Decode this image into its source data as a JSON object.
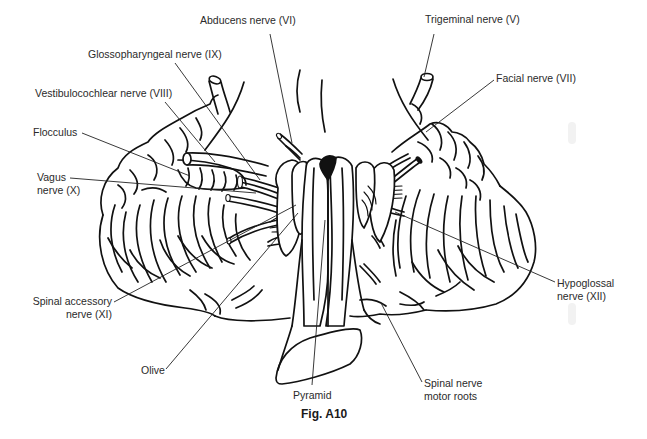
{
  "figure": {
    "caption": "Fig. A10",
    "colors": {
      "line": "#111111",
      "label_text": "#2a2a2a",
      "background": "#ffffff"
    }
  },
  "labels": [
    {
      "id": "abducens",
      "line1": "Abducens nerve (VI)",
      "line2": "",
      "x": 200,
      "y": 20,
      "align": "left",
      "leader": [
        270,
        34,
        292,
        143
      ]
    },
    {
      "id": "trigeminal",
      "line1": "Trigeminal nerve (V)",
      "line2": "",
      "x": 425,
      "y": 19,
      "align": "left",
      "leader": [
        434,
        34,
        424,
        77
      ]
    },
    {
      "id": "glossopharyngeal",
      "line1": "Glossopharyngeal nerve (IX)",
      "line2": "",
      "x": 88,
      "y": 48,
      "align": "left",
      "leader": [
        175,
        63,
        260,
        180
      ]
    },
    {
      "id": "facial",
      "line1": "Facial nerve (VII)",
      "line2": "",
      "x": 496,
      "y": 72,
      "align": "left",
      "leader": [
        494,
        80,
        426,
        132
      ]
    },
    {
      "id": "vestibulocochlear",
      "line1": "Vestibulocochlear nerve (VIII)",
      "line2": "",
      "x": 35,
      "y": 87,
      "align": "left",
      "leader": [
        165,
        102,
        215,
        162
      ]
    },
    {
      "id": "flocculus",
      "line1": "Flocculus",
      "line2": "",
      "x": 33,
      "y": 125,
      "align": "left",
      "leader": [
        82,
        133,
        190,
        176
      ]
    },
    {
      "id": "vagus",
      "line1": "Vagus",
      "line2": "nerve (X)",
      "x": 37,
      "y": 171,
      "align": "left",
      "leader": [
        70,
        178,
        256,
        193
      ]
    },
    {
      "id": "spinal_accessory",
      "line1": "Spinal accessory",
      "line2": "nerve (XI)",
      "x": 34,
      "y": 296,
      "align": "right",
      "width": 78,
      "leader": [
        114,
        302,
        296,
        205
      ]
    },
    {
      "id": "olive",
      "line1": "Olive",
      "line2": "",
      "x": 140,
      "y": 365,
      "align": "left",
      "leader": [
        166,
        369,
        298,
        213
      ]
    },
    {
      "id": "pyramid",
      "line1": "Pyramid",
      "line2": "",
      "x": 292,
      "y": 389,
      "align": "left",
      "leader": [
        312,
        385,
        325,
        220
      ]
    },
    {
      "id": "hypoglossal",
      "line1": "Hypoglossal",
      "line2": "nerve (XII)",
      "x": 557,
      "y": 277,
      "align": "left",
      "leader": [
        555,
        282,
        395,
        212
      ]
    },
    {
      "id": "spinal_nerve_motor_roots",
      "line1": "Spinal nerve",
      "line2": "motor roots",
      "x": 424,
      "y": 377,
      "align": "left",
      "leader": [
        422,
        382,
        381,
        303
      ]
    }
  ]
}
